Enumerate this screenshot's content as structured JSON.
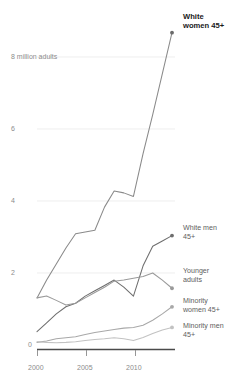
{
  "chart_data": {
    "type": "line",
    "title": "",
    "subtitle": "",
    "xlabel": "",
    "ylabel": "",
    "y_axis_caption": "8 million adults",
    "grid": true,
    "legend_position": "right-inline",
    "xlim": [
      2000,
      2014
    ],
    "ylim": [
      0,
      9.2
    ],
    "x_ticks": [
      2000,
      2005,
      2010
    ],
    "x_tick_labels": [
      "2000",
      "2005",
      "2010"
    ],
    "y_ticks": [
      0,
      2,
      4,
      6,
      8
    ],
    "y_tick_labels": [
      "0",
      "2",
      "4",
      "6",
      "8 million adults"
    ],
    "x": [
      2000,
      2001,
      2002,
      2003,
      2004,
      2005,
      2006,
      2007,
      2008,
      2009,
      2010,
      2011,
      2012,
      2013,
      2014
    ],
    "series": [
      {
        "name": "White women 45+",
        "label": "White\nwomen 45+",
        "color": "#8a8a8a",
        "emphasis": true,
        "end_marker": true,
        "values": [
          1.45,
          1.95,
          2.4,
          2.85,
          3.25,
          3.3,
          3.35,
          4.0,
          4.45,
          4.4,
          4.3,
          5.5,
          6.6,
          7.75,
          8.9
        ]
      },
      {
        "name": "White men 45+",
        "label": "White men\n45+",
        "color": "#6e6e6e",
        "emphasis": false,
        "end_marker": true,
        "values": [
          0.5,
          0.75,
          1.0,
          1.2,
          1.3,
          1.5,
          1.65,
          1.8,
          1.95,
          1.75,
          1.5,
          2.35,
          2.9,
          3.05,
          3.2
        ]
      },
      {
        "name": "Younger adults",
        "label": "Younger\nadults",
        "color": "#9a9a9a",
        "emphasis": false,
        "end_marker": true,
        "values": [
          1.45,
          1.5,
          1.38,
          1.25,
          1.3,
          1.45,
          1.6,
          1.75,
          1.92,
          1.95,
          2.0,
          2.05,
          2.15,
          1.95,
          1.72
        ]
      },
      {
        "name": "Minority women 45+",
        "label": "Minority\nwomen 45+",
        "color": "#a8a8a8",
        "emphasis": false,
        "end_marker": true,
        "values": [
          0.2,
          0.24,
          0.3,
          0.33,
          0.36,
          0.42,
          0.48,
          0.52,
          0.56,
          0.6,
          0.62,
          0.68,
          0.82,
          1.0,
          1.2
        ]
      },
      {
        "name": "Minority men 45+",
        "label": "Minority men\n45+",
        "color": "#c2c2c2",
        "emphasis": false,
        "end_marker": true,
        "values": [
          0.22,
          0.2,
          0.19,
          0.2,
          0.22,
          0.25,
          0.28,
          0.3,
          0.33,
          0.3,
          0.25,
          0.34,
          0.45,
          0.55,
          0.62
        ]
      }
    ]
  },
  "legend": {
    "white_women": "White\nwomen 45+",
    "white_men": "White men\n45+",
    "younger_adults": "Younger\nadults",
    "minority_women": "Minority\nwomen 45+",
    "minority_men": "Minority men\n45+"
  },
  "axis": {
    "y_label_8": "8 million adults",
    "y_label_6": "6",
    "y_label_4": "4",
    "y_label_2": "2",
    "y_label_0": "0",
    "x_label_2000": "2000",
    "x_label_2005": "2005",
    "x_label_2010": "2010"
  },
  "colors": {
    "grid": "#e6e6e6",
    "axis": "#4a4a4a",
    "tick_text": "#8c8c8c",
    "legend_text": "#5e5e5e",
    "highlight_text": "#1a1a1a"
  }
}
